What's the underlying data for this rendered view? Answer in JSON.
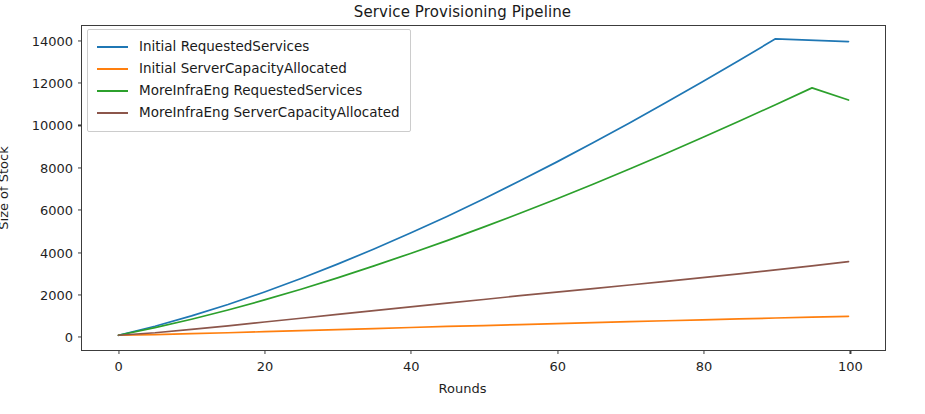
{
  "chart_data": {
    "type": "line",
    "title": "Service Provisioning Pipeline",
    "xlabel": "Rounds",
    "ylabel": "Size of Stock",
    "xlim": [
      -5,
      105
    ],
    "ylim": [
      -700,
      14700
    ],
    "xticks": [
      0,
      20,
      40,
      60,
      80,
      100
    ],
    "yticks": [
      0,
      2000,
      4000,
      6000,
      8000,
      10000,
      12000,
      14000
    ],
    "grid": false,
    "legend_position": "upper left",
    "x": [
      0,
      5,
      10,
      15,
      20,
      25,
      30,
      35,
      40,
      45,
      50,
      55,
      60,
      65,
      70,
      75,
      80,
      85,
      90,
      95,
      100
    ],
    "series": [
      {
        "name": "Initial RequestedServices",
        "color": "#1f77b4",
        "values": [
          0,
          430,
          920,
          1460,
          2060,
          2700,
          3380,
          4100,
          4860,
          5650,
          6480,
          7340,
          8230,
          9150,
          10090,
          11060,
          12050,
          13060,
          14090,
          15140,
          13960
        ]
      },
      {
        "name": "Initial ServerCapacityAllocated",
        "color": "#ff7f0e",
        "values": [
          0,
          35,
          75,
          120,
          170,
          220,
          270,
          320,
          370,
          420,
          460,
          510,
          555,
          600,
          645,
          690,
          735,
          780,
          820,
          860,
          900
        ]
      },
      {
        "name": "MoreInfraEng RequestedServices",
        "color": "#2ca02c",
        "values": [
          0,
          360,
          760,
          1200,
          1680,
          2190,
          2730,
          3300,
          3890,
          4500,
          5140,
          5800,
          6480,
          7180,
          7900,
          8640,
          9400,
          10170,
          10960,
          11760,
          11180
        ]
      },
      {
        "name": "MoreInfraEng ServerCapacityAllocated",
        "color": "#8c564b",
        "values": [
          0,
          120,
          280,
          450,
          630,
          810,
          990,
          1170,
          1350,
          1530,
          1700,
          1880,
          2050,
          2220,
          2390,
          2560,
          2740,
          2920,
          3110,
          3300,
          3500
        ]
      }
    ]
  }
}
